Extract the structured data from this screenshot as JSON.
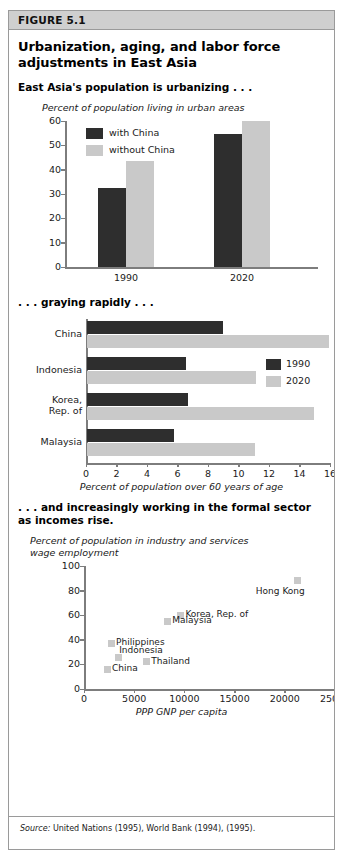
{
  "figure": {
    "label": "FIGURE 5.1",
    "title_line1": "Urbanization, aging, and labor force",
    "title_line2": "adjustments in East Asia",
    "source_prefix": "Source:",
    "source_text": " United Nations (1995), World Bank (1994), (1995)."
  },
  "colors": {
    "dark": "#2e2e2e",
    "light": "#c9c9c9",
    "header_bg": "#cfcfcf",
    "border": "#9a9a9a",
    "axis": "#7d7d7d"
  },
  "chart_data": [
    {
      "id": "urbanization",
      "type": "bar",
      "heading": "East Asia's population is urbanizing . . .",
      "title": "Percent of population living in urban areas",
      "xlabel": "",
      "ylabel": "Percent of population living in urban areas",
      "ylim": [
        0,
        60
      ],
      "yticks": [
        0,
        10,
        20,
        30,
        40,
        50,
        60
      ],
      "categories": [
        "1990",
        "2020"
      ],
      "grid": false,
      "legend_position": "top-left",
      "series": [
        {
          "name": "with China",
          "values": [
            32.5,
            54.5
          ],
          "color": "#2e2e2e"
        },
        {
          "name": "without China",
          "values": [
            43.5,
            60.0
          ],
          "color": "#c9c9c9"
        }
      ]
    },
    {
      "id": "aging",
      "type": "bar",
      "orientation": "horizontal",
      "heading": ". . . graying rapidly . . .",
      "title": "",
      "xlabel": "Percent of population over 60 years of age",
      "ylabel": "",
      "xlim": [
        0,
        16
      ],
      "xticks": [
        0,
        2,
        4,
        6,
        8,
        10,
        12,
        14,
        16
      ],
      "categories": [
        "China",
        "Indonesia",
        "Korea,\nRep. of",
        "Malaysia"
      ],
      "grid": false,
      "legend_position": "middle-right",
      "series": [
        {
          "name": "1990",
          "values": [
            8.9,
            6.5,
            6.6,
            5.7
          ],
          "color": "#2e2e2e"
        },
        {
          "name": "2020",
          "values": [
            15.9,
            11.1,
            14.9,
            11.0
          ],
          "color": "#c9c9c9"
        }
      ]
    },
    {
      "id": "formal-sector",
      "type": "scatter",
      "heading_line1": ". . . and increasingly working in the formal sector",
      "heading_line2": "as incomes rise.",
      "title_line1": "Percent of population in industry and services",
      "title_line2": "wage employment",
      "xlabel": "PPP GNP per capita",
      "ylabel": "Percent of population in industry and services wage employment",
      "xlim": [
        0,
        25000
      ],
      "ylim": [
        0,
        100
      ],
      "xticks": [
        0,
        5000,
        10000,
        15000,
        20000,
        25000
      ],
      "yticks": [
        0,
        20,
        40,
        60,
        80,
        100
      ],
      "grid": false,
      "marker_color": "#c9c9c9",
      "points": [
        {
          "label": "Hong Kong",
          "x": 21300,
          "y": 88,
          "label_pos": "below-left"
        },
        {
          "label": "Korea, Rep. of",
          "x": 9600,
          "y": 60,
          "label_pos": "right"
        },
        {
          "label": "Malaysia",
          "x": 8300,
          "y": 55,
          "label_pos": "right"
        },
        {
          "label": "Philippines",
          "x": 2700,
          "y": 37,
          "label_pos": "right"
        },
        {
          "label": "Indonesia",
          "x": 3400,
          "y": 26,
          "label_pos": "above-right"
        },
        {
          "label": "Thailand",
          "x": 6200,
          "y": 22,
          "label_pos": "right"
        },
        {
          "label": "China",
          "x": 2300,
          "y": 16,
          "label_pos": "right"
        }
      ]
    }
  ]
}
